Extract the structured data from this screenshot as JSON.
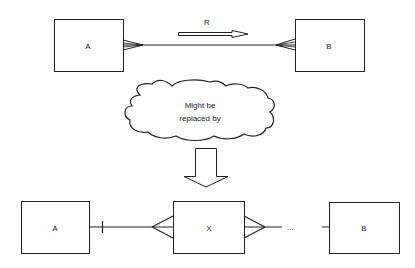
{
  "top": {
    "entity_a": "A",
    "entity_b": "B",
    "relationship_label": "R"
  },
  "cloud": {
    "line1": "Might be",
    "line2": "replaced by"
  },
  "bottom": {
    "entity_a": "A",
    "entity_x": "X",
    "entity_b": "B",
    "ellipsis": "..."
  },
  "colors": {
    "stroke": "#222222",
    "background": "#ffffff"
  }
}
